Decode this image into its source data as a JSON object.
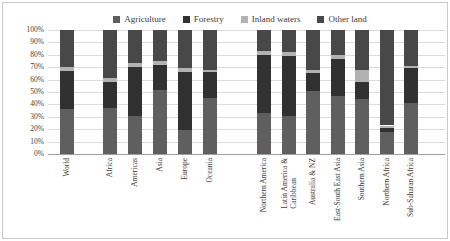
{
  "frame": {
    "border_color": "#c9c9c9",
    "background": "#ffffff"
  },
  "y_axis": {
    "ticks": [
      "100%",
      "90%",
      "80%",
      "70%",
      "60%",
      "50%",
      "40%",
      "30%",
      "20%",
      "10%",
      "0%"
    ]
  },
  "chart_data": {
    "type": "bar",
    "stacked": true,
    "title": "",
    "xlabel": "",
    "ylabel": "",
    "unit": "percent of total area",
    "ylim": [
      0,
      100
    ],
    "ytick_step": 10,
    "grid": true,
    "legend_position": "top",
    "categories": [
      "World",
      "Africa",
      "Americas",
      "Asia",
      "Europe",
      "Oceania",
      "Northern America",
      "Latin America &\nCaribbean",
      "Australia & NZ",
      "East-South East Asia",
      "Southern Asia",
      "Northern Africa",
      "Sub-Saharan Africa"
    ],
    "group_gaps_after": [
      "World",
      "Oceania"
    ],
    "series": [
      {
        "name": "Agriculture",
        "color": "#5f5f5f",
        "values": [
          36,
          37,
          31,
          52,
          19,
          45,
          33,
          31,
          51,
          47,
          44,
          18,
          41
        ]
      },
      {
        "name": "Forestry",
        "color": "#313131",
        "values": [
          31,
          21,
          39,
          20,
          47,
          21,
          47,
          48,
          14,
          30,
          14,
          3,
          28
        ]
      },
      {
        "name": "Inland waters",
        "color": "#b2b2b2",
        "values": [
          3,
          3,
          3,
          3,
          3,
          2,
          3,
          3,
          3,
          3,
          10,
          2,
          2
        ]
      },
      {
        "name": "Other land",
        "color": "#484848",
        "values": [
          30,
          39,
          27,
          25,
          31,
          32,
          17,
          18,
          32,
          20,
          32,
          77,
          29
        ]
      }
    ]
  }
}
